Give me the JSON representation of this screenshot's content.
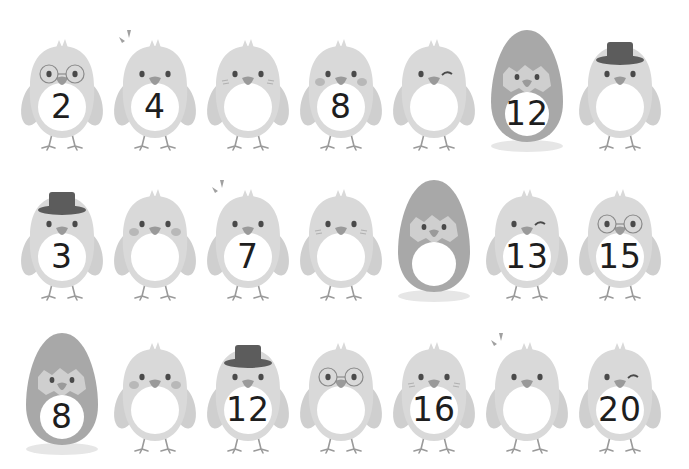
{
  "worksheet": {
    "colors": {
      "body": "#d9d9d9",
      "body_shade": "#cfcfcf",
      "belly": "#ffffff",
      "egg": "#a8a8a8",
      "egg_shadow": "#e6e6e6",
      "hat": "#5c5c5c",
      "beak": "#9a9a9a",
      "eye": "#4a4a4a",
      "cheek": "#b8b8b8",
      "number": "#1e1e1e"
    },
    "rows": [
      {
        "cells": [
          {
            "type": "chick",
            "accessory": "glasses",
            "number": "2"
          },
          {
            "type": "chick",
            "accessory": "surprise-marks",
            "number": "4"
          },
          {
            "type": "chick",
            "accessory": "blush-lines",
            "number": ""
          },
          {
            "type": "chick",
            "accessory": "cheeks",
            "number": "8"
          },
          {
            "type": "chick",
            "accessory": "wink",
            "number": ""
          },
          {
            "type": "egg",
            "accessory": "none",
            "number": "12"
          },
          {
            "type": "chick",
            "accessory": "top-hat",
            "number": ""
          }
        ]
      },
      {
        "cells": [
          {
            "type": "chick",
            "accessory": "top-hat",
            "number": "3"
          },
          {
            "type": "chick",
            "accessory": "cheeks",
            "number": ""
          },
          {
            "type": "chick",
            "accessory": "surprise-marks",
            "number": "7"
          },
          {
            "type": "chick",
            "accessory": "blush-lines",
            "number": ""
          },
          {
            "type": "egg",
            "accessory": "none",
            "number": ""
          },
          {
            "type": "chick",
            "accessory": "wink",
            "number": "13"
          },
          {
            "type": "chick",
            "accessory": "glasses",
            "number": "15"
          }
        ]
      },
      {
        "cells": [
          {
            "type": "egg",
            "accessory": "none",
            "number": "8"
          },
          {
            "type": "chick",
            "accessory": "cheeks",
            "number": ""
          },
          {
            "type": "chick",
            "accessory": "top-hat",
            "number": "12"
          },
          {
            "type": "chick",
            "accessory": "glasses",
            "number": ""
          },
          {
            "type": "chick",
            "accessory": "blush-lines",
            "number": "16"
          },
          {
            "type": "chick",
            "accessory": "surprise-marks",
            "number": ""
          },
          {
            "type": "chick",
            "accessory": "wink",
            "number": "20"
          }
        ]
      }
    ]
  }
}
